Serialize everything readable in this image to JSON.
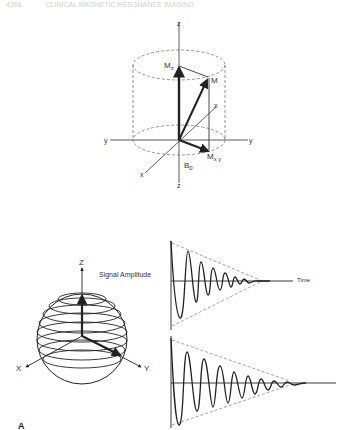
{
  "header": {
    "page_number": "4266",
    "running_title": "CLINICAL MAGNETIC RESONANCE IMAGING"
  },
  "top_diagram": {
    "axis_labels": {
      "z_top": "z",
      "z_bottom": "z",
      "y_left": "y",
      "y_right": "y",
      "x_front": "x",
      "x_back": "x"
    },
    "vector_labels": {
      "mz": "M",
      "mz_sub": "z",
      "m": "M",
      "mxy": "M",
      "mxy_sub": "x y",
      "b0": "B",
      "b0_sub": "0"
    }
  },
  "bottom_diagram": {
    "sphere_axis_labels": {
      "z": "Z",
      "x": "X",
      "y": "Y"
    },
    "signal_label": "Signal Amplitude",
    "time_label": "Time",
    "panel_letter": "A"
  },
  "colors": {
    "ink": "#222222",
    "dashed": "#777777",
    "background": "#ffffff"
  }
}
